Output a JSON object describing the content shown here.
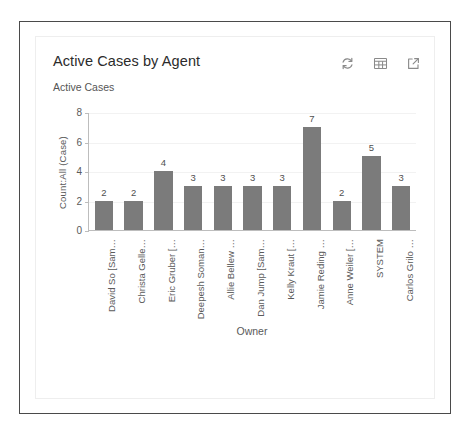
{
  "card": {
    "title": "Active Cases by Agent",
    "subtitle": "Active Cases",
    "tools": [
      {
        "name": "refresh-icon",
        "label": "Refresh"
      },
      {
        "name": "table-view-icon",
        "label": "Show as table"
      },
      {
        "name": "expand-icon",
        "label": "Expand"
      }
    ]
  },
  "colors": {
    "bar": "#7b7b7b",
    "axis": "#bdbdbd",
    "grid": "#f2f2f2",
    "text": "#5a5a5a",
    "title": "#2b2b2b",
    "outer_border": "#4a4a4a",
    "panel_border": "#eeeeee"
  },
  "chart_data": {
    "type": "bar",
    "title": "Active Cases by Agent",
    "subtitle": "Active Cases",
    "xlabel": "Owner",
    "ylabel": "Count:All (Case)",
    "ylim": [
      0,
      8
    ],
    "yticks": [
      0,
      2,
      4,
      6,
      8
    ],
    "grid": true,
    "legend": "none",
    "show_values": true,
    "categories": [
      "David So [Sam…",
      "Christa Gelle…",
      "Eric Gruber […",
      "Deepesh Soman…",
      "Allie Bellew …",
      "Dan Jump [Sam…",
      "Kelly Kraut […",
      "Jamie Reding …",
      "Anne Weiler […",
      "SYSTEM",
      "Carlos Grilo …"
    ],
    "values": [
      2,
      2,
      4,
      3,
      3,
      3,
      3,
      7,
      2,
      5,
      3
    ]
  }
}
